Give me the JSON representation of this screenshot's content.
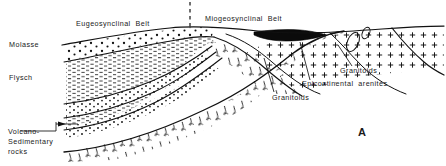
{
  "figure": {
    "kind": "geological-cross-section",
    "panel_label": "A",
    "ink_color": "#000000",
    "paper_color": "#ffffff"
  },
  "belt_labels": {
    "eugeosynclinal": "Eugeosynclinal  Belt",
    "miogeosynclinal": "Miogeosynclinal  Belt"
  },
  "left_labels": {
    "molasse": "Molasse",
    "flysch": "Flysch",
    "volcano_line1": "Volcano-",
    "volcano_line2": "Sedimentary",
    "volcano_line3": "rocks"
  },
  "right_labels": {
    "granitoids_upper": "Granitoids",
    "epicontinental_arenites": "Epicontinental  arenites",
    "granitoids_lower": "Granitoids"
  },
  "units": [
    {
      "name": "Molasse",
      "pattern": "sparse-dots",
      "description": "uppermost wedge, sparse coarse dots"
    },
    {
      "name": "Flysch",
      "pattern": "dense-dashes",
      "description": "thick middle body of dense short horizontal dashes"
    },
    {
      "name": "Volcano-Sedimentary rocks",
      "pattern": "hook-marks",
      "description": "lower-left body with J-shaped volcanic hook marks"
    },
    {
      "name": "Granitoids",
      "pattern": "plus-grid",
      "description": "right-side basement body with plus-sign grid"
    },
    {
      "name": "Epicontinental arenites",
      "pattern": "solid-black",
      "description": "thin dark lens at top of miogeosynclinal belt"
    }
  ],
  "divider": {
    "style": "dashed-vertical",
    "x": 190
  }
}
